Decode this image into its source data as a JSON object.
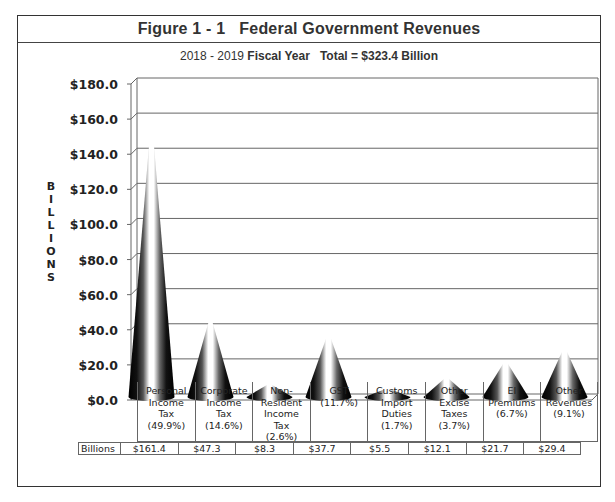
{
  "figure": {
    "title": "Figure 1 - 1   Federal Government Revenues",
    "subtitle_year": "2018 - 2019",
    "subtitle_fiscal": "Fiscal Year",
    "subtitle_total": "Total = $323.4 Billion"
  },
  "axis": {
    "ylabel_letters": [
      "B",
      "I",
      "L",
      "L",
      "I",
      "O",
      "N",
      "S"
    ],
    "ticks": [
      "$180.0",
      "$160.0",
      "$140.0",
      "$120.0",
      "$100.0",
      "$80.0",
      "$60.0",
      "$40.0",
      "$20.0",
      "$0.0"
    ]
  },
  "table": {
    "row_header": "Billions",
    "categories": [
      {
        "label": "Personal\nIncome\nTax\n(49.9%)",
        "value": "$161.4"
      },
      {
        "label": "Corporate\nIncome\nTax\n(14.6%)",
        "value": "$47.3"
      },
      {
        "label": "Non-\nResident\nIncome\nTax\n(2.6%)",
        "value": "$8.3"
      },
      {
        "label": "GST\n(11.7%)",
        "value": "$37.7"
      },
      {
        "label": "Customs\nImport\nDuties\n(1.7%)",
        "value": "$5.5"
      },
      {
        "label": "Other\nExcise\nTaxes\n(3.7%)",
        "value": "$12.1"
      },
      {
        "label": "EI\nPremiums\n(6.7%)",
        "value": "$21.7"
      },
      {
        "label": "Other\nRevenues\n(9.1%)",
        "value": "$29.4"
      }
    ]
  },
  "chart_data": {
    "type": "bar",
    "style": "3d-cone",
    "title": "Figure 1 - 1 Federal Government Revenues",
    "subtitle": "2018 - 2019 Fiscal Year Total = $323.4 Billion",
    "xlabel": "",
    "ylabel": "BILLIONS",
    "ylim": [
      0,
      180
    ],
    "yticks": [
      0,
      20,
      40,
      60,
      80,
      100,
      120,
      140,
      160,
      180
    ],
    "grid": true,
    "legend": "none",
    "categories": [
      "Personal Income Tax",
      "Corporate Income Tax",
      "Non-Resident Income Tax",
      "GST",
      "Customs Import Duties",
      "Other Excise Taxes",
      "EI Premiums",
      "Other Revenues"
    ],
    "percentages": [
      49.9,
      14.6,
      2.6,
      11.7,
      1.7,
      3.7,
      6.7,
      9.1
    ],
    "values": [
      161.4,
      47.3,
      8.3,
      37.7,
      5.5,
      12.1,
      21.7,
      29.4
    ],
    "units": "Billions of dollars"
  }
}
